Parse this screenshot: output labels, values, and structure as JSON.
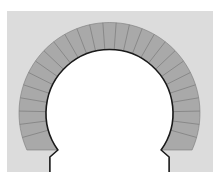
{
  "diagram": {
    "colors": {
      "page": "#ffffff",
      "background": "#dcdcdc",
      "voussoir_fill": "#a9a9a9",
      "joint_line": "#7a7a7a",
      "intrados_line": "#1a1a1a",
      "opening": "#ffffff"
    },
    "geometry": {
      "center_x": 109.5,
      "center_y": 113,
      "outer_radius": 90.5,
      "inner_radius": 63.5,
      "springing_y": 150,
      "voussoir_count": 27
    }
  }
}
